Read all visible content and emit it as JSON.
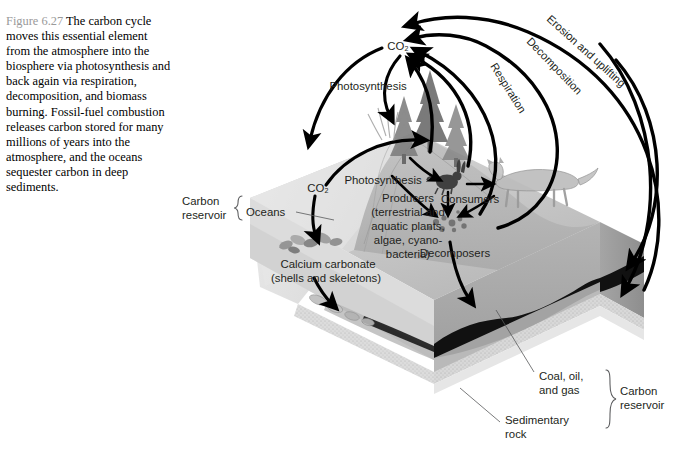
{
  "figure": {
    "number": "Figure 6.27",
    "caption": "The carbon cycle moves this essential element from the atmosphere into the biosphere via photosynthesis and back again via respiration, decomposition, and biomass burning. Fossil-fuel combustion releases carbon stored for many millions of years into the atmosphere, and the oceans sequester carbon in deep sediments."
  },
  "diagram": {
    "atmosphere_pool": "CO₂",
    "ocean_pool": "CO₂",
    "flux_labels": {
      "photosynthesis_land": "Photosynthesis",
      "photosynthesis_ocean": "Photosynthesis",
      "respiration": "Respiration",
      "decomposition": "Decomposition",
      "erosion": "Erosion and uplifting"
    },
    "compartments": {
      "producers_line1": "Producers",
      "producers_line2": "(terrestrial and",
      "producers_line3": "aquatic plants,",
      "producers_line4": "algae, cyano-",
      "producers_line5": "bacteria)",
      "consumers": "Consumers",
      "decomposers": "Decomposers",
      "calcium_line1": "Calcium carbonate",
      "calcium_line2": "(shells and skeletons)"
    },
    "reservoirs": {
      "left_label_line1": "Carbon",
      "left_label_line2": "reservoir",
      "left_item": "Oceans",
      "right_label_line1": "Carbon",
      "right_label_line2": "reservoir",
      "right_item1_line1": "Coal, oil,",
      "right_item1_line2": "and gas",
      "right_item2_line1": "Sedimentary",
      "right_item2_line2": "rock"
    },
    "colors": {
      "ink": "#231f20",
      "fignum_gray": "#9a9a9a",
      "leader_gray": "#58595b",
      "top_surface": "#c9c9c9",
      "ocean_face": "#e3e3e3",
      "front_face": "#a8a8a8",
      "right_face": "#9c9c9c",
      "coal": "#111111",
      "sediment": "#d5d5d5"
    }
  }
}
